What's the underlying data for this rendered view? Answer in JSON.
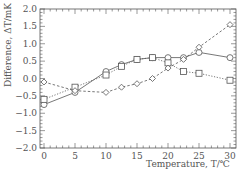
{
  "chart_data": {
    "type": "line",
    "title": "",
    "xlabel": "Temperature, T/℃",
    "ylabel": "Difference, ΔT/mK",
    "xlim": [
      0,
      30
    ],
    "ylim": [
      -2.0,
      2.0
    ],
    "xticks": [
      0,
      5,
      10,
      15,
      20,
      25,
      30
    ],
    "yticks": [
      2.0,
      1.5,
      1.0,
      0.5,
      0.0,
      -0.5,
      -1.0,
      -1.5,
      -2.0
    ],
    "ytick_labels": [
      "2.0",
      "1.5",
      "1.0",
      "0.5",
      "0.0",
      "−0.5",
      "−1.0",
      "−1.5",
      "−2.0"
    ],
    "grid": false,
    "legend": null,
    "x": [
      0,
      5,
      10,
      12.5,
      15,
      17.5,
      20,
      22.5,
      25,
      30
    ],
    "series": [
      {
        "name": "circle",
        "marker": "circle",
        "line": "solid",
        "values": [
          -0.75,
          -0.4,
          0.2,
          0.4,
          0.55,
          0.6,
          0.6,
          0.6,
          0.75,
          0.6
        ]
      },
      {
        "name": "square",
        "marker": "square",
        "line": "dotted",
        "values": [
          -0.6,
          -0.25,
          0.1,
          0.35,
          0.55,
          0.6,
          0.45,
          0.2,
          0.15,
          -0.05
        ]
      },
      {
        "name": "diamond",
        "marker": "diamond",
        "line": "dashed",
        "values": [
          -0.1,
          -0.35,
          -0.4,
          -0.25,
          -0.15,
          0.0,
          0.3,
          0.55,
          0.9,
          1.55
        ]
      }
    ]
  },
  "colors": {
    "axis": "#555555",
    "series": "#555555"
  }
}
